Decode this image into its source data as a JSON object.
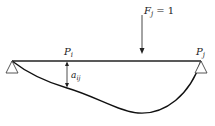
{
  "diagram": {
    "type": "beam-deflection-influence",
    "load": {
      "symbol": "F",
      "subscript": "j",
      "equals": "= 1"
    },
    "point_i": {
      "symbol": "P",
      "subscript": "i"
    },
    "point_j": {
      "symbol": "P",
      "subscript": "j"
    },
    "deflection": {
      "symbol": "a",
      "subscript": "ij"
    },
    "colors": {
      "beam": "#222222",
      "curve": "#111111",
      "support": "#444444"
    }
  }
}
